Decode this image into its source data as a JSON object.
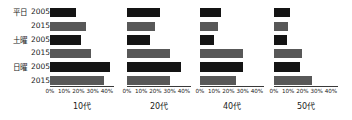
{
  "chart_data": {
    "type": "bar",
    "orientation": "horizontal",
    "title": "",
    "xlabel": "",
    "ylabel": "",
    "xlim": [
      0,
      45
    ],
    "grid": false,
    "legend": "none",
    "tick_labels": [
      "0%",
      "10%",
      "20%",
      "30%",
      "40%"
    ],
    "tick_values": [
      0,
      10,
      20,
      30,
      40
    ],
    "categories": [
      "平日",
      "土曜",
      "日曜"
    ],
    "series": [
      {
        "name": "2005",
        "color": "#141414"
      },
      {
        "name": "2015",
        "color": "#585858"
      }
    ],
    "panels": [
      {
        "title": "10代",
        "rows": [
          {
            "category": "平日",
            "year": "2005",
            "value": 18
          },
          {
            "category": "平日",
            "year": "2015",
            "value": 25
          },
          {
            "category": "土曜",
            "year": "2005",
            "value": 22
          },
          {
            "category": "土曜",
            "year": "2015",
            "value": 29
          },
          {
            "category": "日曜",
            "year": "2005",
            "value": 42
          },
          {
            "category": "日曜",
            "year": "2015",
            "value": 38
          }
        ]
      },
      {
        "title": "20代",
        "rows": [
          {
            "category": "平日",
            "year": "2005",
            "value": 23
          },
          {
            "category": "平日",
            "year": "2015",
            "value": 20
          },
          {
            "category": "土曜",
            "year": "2005",
            "value": 16
          },
          {
            "category": "土曜",
            "year": "2015",
            "value": 30
          },
          {
            "category": "日曜",
            "year": "2005",
            "value": 38
          },
          {
            "category": "日曜",
            "year": "2015",
            "value": 30
          }
        ]
      },
      {
        "title": "40代",
        "rows": [
          {
            "category": "平日",
            "year": "2005",
            "value": 15
          },
          {
            "category": "平日",
            "year": "2015",
            "value": 13
          },
          {
            "category": "土曜",
            "year": "2005",
            "value": 10
          },
          {
            "category": "土曜",
            "year": "2015",
            "value": 30
          },
          {
            "category": "日曜",
            "year": "2005",
            "value": 30
          },
          {
            "category": "日曜",
            "year": "2015",
            "value": 25
          }
        ]
      },
      {
        "title": "50代",
        "rows": [
          {
            "category": "平日",
            "year": "2005",
            "value": 11
          },
          {
            "category": "平日",
            "year": "2015",
            "value": 10
          },
          {
            "category": "土曜",
            "year": "2005",
            "value": 9
          },
          {
            "category": "土曜",
            "year": "2015",
            "value": 20
          },
          {
            "category": "日曜",
            "year": "2005",
            "value": 18
          },
          {
            "category": "日曜",
            "year": "2015",
            "value": 27
          }
        ]
      }
    ]
  },
  "row_labels": [
    {
      "category": "平日",
      "years": [
        "2005",
        "2015"
      ]
    },
    {
      "category": "土曜",
      "years": [
        "2005",
        "2015"
      ]
    },
    {
      "category": "日曜",
      "years": [
        "2005",
        "2015"
      ]
    }
  ]
}
